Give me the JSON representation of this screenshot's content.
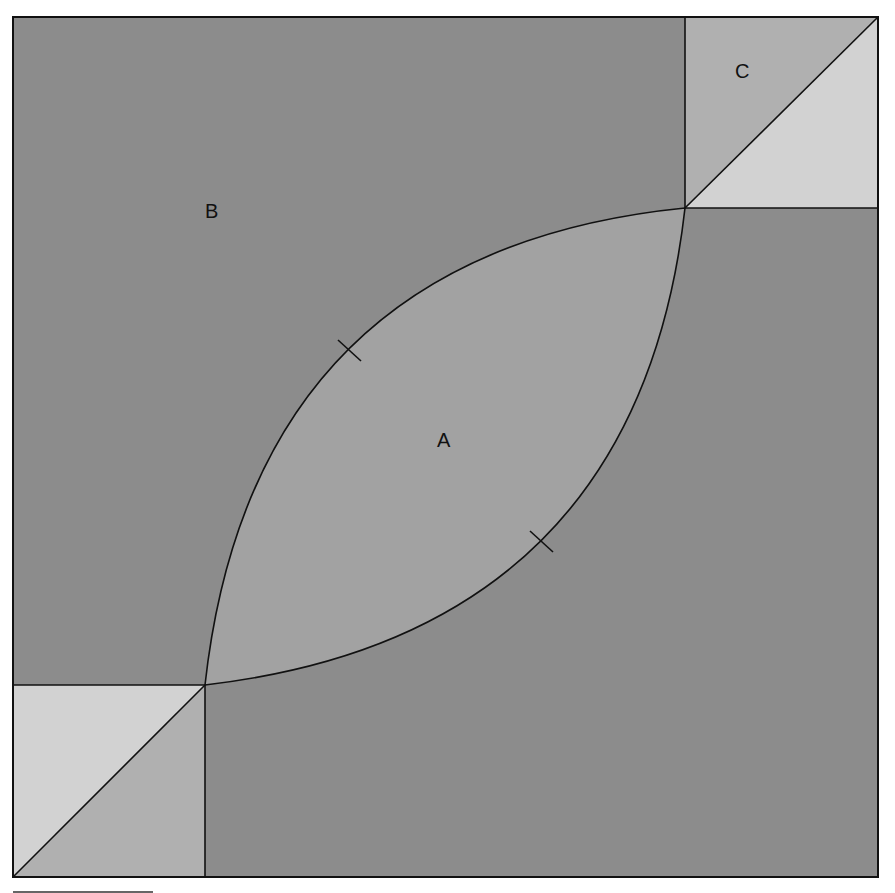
{
  "diagram": {
    "labels": {
      "lens": "A",
      "background": "B",
      "corner": "C"
    },
    "colors": {
      "background_region": "#8c8c8c",
      "lens_region": "#a2a2a2",
      "corner_dark_triangle": "#b0b0b0",
      "corner_light_triangle": "#d2d2d2",
      "stroke": "#111111"
    },
    "tick_marks": 2
  }
}
